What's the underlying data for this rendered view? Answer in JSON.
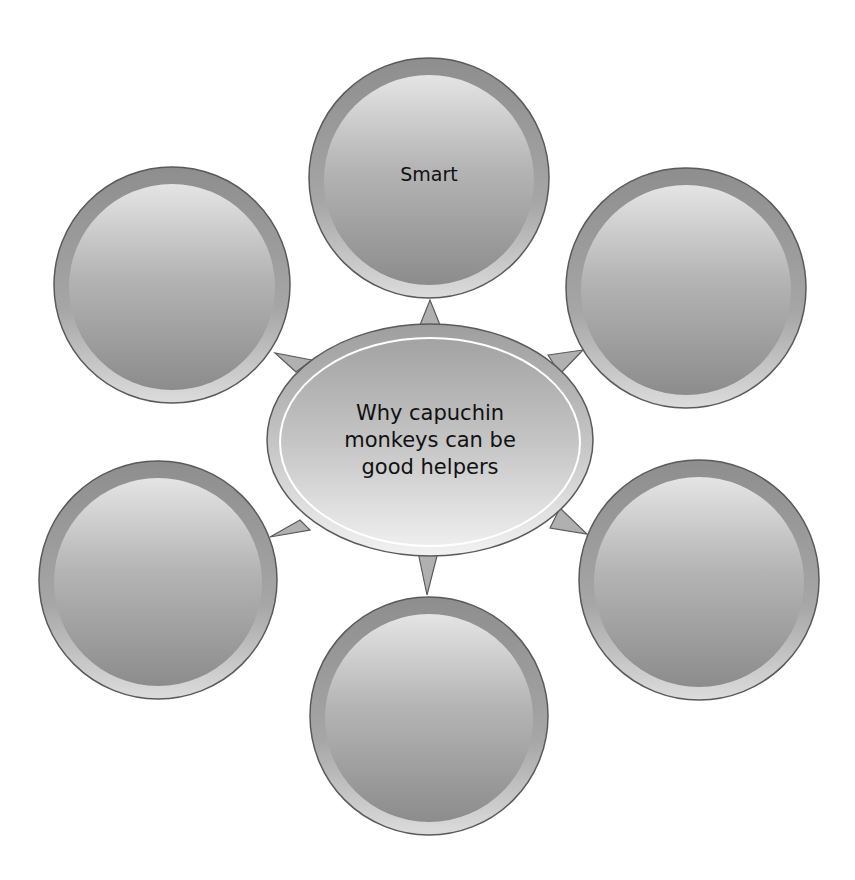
{
  "diagram": {
    "type": "bubble-map",
    "center": {
      "label": "Why capuchin monkeys can be good helpers",
      "lines": [
        "Why capuchin",
        "monkeys can be",
        "good helpers"
      ]
    },
    "nodes": [
      {
        "position": "top",
        "label": "Smart"
      },
      {
        "position": "top-right",
        "label": ""
      },
      {
        "position": "bottom-right",
        "label": ""
      },
      {
        "position": "bottom",
        "label": ""
      },
      {
        "position": "bottom-left",
        "label": ""
      },
      {
        "position": "top-left",
        "label": ""
      }
    ]
  },
  "colors": {
    "background": "#ffffff",
    "outline": "#5a5a5a",
    "fill_light": "#e2e2e2",
    "fill_dark": "#8a8a8a",
    "rim": "#9a9a9a"
  }
}
